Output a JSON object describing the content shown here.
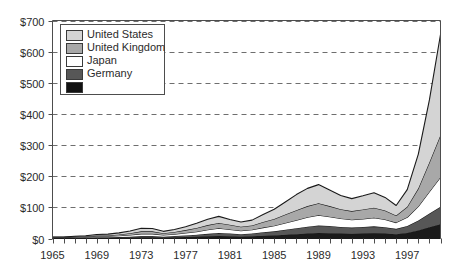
{
  "chart_data": {
    "type": "area",
    "stacked": true,
    "title": "",
    "subtitle": "",
    "xlabel": "",
    "ylabel": "",
    "xlim": [
      1965,
      2000
    ],
    "ylim": [
      0,
      700
    ],
    "grid": true,
    "grid_style": "dashed-horizontal",
    "legend_position": "top-left",
    "y_tick_labels": [
      "$0",
      "$100",
      "$200",
      "$300",
      "$400",
      "$500",
      "$600",
      "$700"
    ],
    "y_tick_values": [
      0,
      100,
      200,
      300,
      400,
      500,
      600,
      700
    ],
    "x_tick_labels": [
      "1965",
      "1969",
      "1973",
      "1977",
      "1981",
      "1985",
      "1989",
      "1993",
      "1997"
    ],
    "x_tick_values": [
      1965,
      1969,
      1973,
      1977,
      1981,
      1985,
      1989,
      1993,
      1997
    ],
    "x_minor_tick_interval": 1,
    "x": [
      1965,
      1966,
      1967,
      1968,
      1969,
      1970,
      1971,
      1972,
      1973,
      1974,
      1975,
      1976,
      1977,
      1978,
      1979,
      1980,
      1981,
      1982,
      1983,
      1984,
      1985,
      1986,
      1987,
      1988,
      1989,
      1990,
      1991,
      1992,
      1993,
      1994,
      1995,
      1996,
      1997,
      1998,
      1999,
      2000
    ],
    "series": [
      {
        "name": "Germany",
        "color": "#1a1a1a",
        "legend_order": 5,
        "stack_order": 1,
        "values": [
          1,
          1,
          1,
          2,
          2,
          2,
          3,
          3,
          4,
          4,
          3,
          4,
          5,
          6,
          7,
          8,
          7,
          6,
          7,
          9,
          10,
          12,
          14,
          16,
          18,
          17,
          16,
          15,
          16,
          17,
          16,
          14,
          18,
          26,
          36,
          46
        ]
      },
      {
        "name": "Japan",
        "color": "#575757",
        "legend_order": 4,
        "stack_order": 2,
        "values": [
          1,
          1,
          1,
          1,
          2,
          2,
          2,
          3,
          4,
          4,
          3,
          4,
          5,
          6,
          8,
          10,
          9,
          8,
          9,
          11,
          13,
          16,
          19,
          22,
          24,
          23,
          21,
          20,
          21,
          22,
          20,
          17,
          22,
          32,
          44,
          56
        ]
      },
      {
        "name": "United Kingdom",
        "color": "#ffffff",
        "legend_order": 3,
        "stack_order": 3,
        "values": [
          1,
          1,
          2,
          2,
          3,
          3,
          4,
          5,
          7,
          7,
          5,
          6,
          8,
          10,
          13,
          15,
          13,
          11,
          12,
          15,
          18,
          22,
          26,
          30,
          33,
          30,
          27,
          25,
          26,
          28,
          25,
          20,
          28,
          45,
          70,
          95
        ]
      },
      {
        "name": "United States",
        "color": "#a8a8a8",
        "legend_order": 2,
        "stack_order": 4,
        "values": [
          1,
          1,
          2,
          2,
          3,
          3,
          4,
          6,
          8,
          8,
          6,
          7,
          9,
          12,
          15,
          17,
          15,
          13,
          14,
          18,
          22,
          27,
          32,
          36,
          38,
          34,
          30,
          28,
          30,
          32,
          29,
          23,
          34,
          58,
          95,
          135
        ]
      },
      {
        "name": "United States",
        "color": "#d4d4d4",
        "legend_order": 1,
        "stack_order": 5,
        "values": [
          1,
          1,
          1,
          2,
          3,
          4,
          5,
          7,
          10,
          9,
          6,
          8,
          11,
          15,
          19,
          21,
          17,
          15,
          17,
          24,
          31,
          40,
          50,
          57,
          60,
          52,
          44,
          40,
          44,
          48,
          42,
          32,
          55,
          110,
          200,
          323
        ]
      }
    ],
    "stack_totals": [
      5,
      5,
      7,
      9,
      13,
      14,
      18,
      24,
      33,
      32,
      23,
      29,
      38,
      49,
      62,
      71,
      61,
      53,
      59,
      77,
      94,
      117,
      141,
      161,
      173,
      156,
      138,
      128,
      137,
      147,
      132,
      106,
      157,
      271,
      445,
      655
    ],
    "notes": {
      "peak_label": "$655 at 2000",
      "local_peak_1989": "$173 total area peak near 1989",
      "legend_swatch_count": 5,
      "legend_label_count": 4
    }
  },
  "legend": {
    "entries": [
      {
        "label": "United States",
        "swatch": "#d4d4d4"
      },
      {
        "label": "United Kingdom",
        "swatch": "#a8a8a8"
      },
      {
        "label": "Japan",
        "swatch": "#ffffff"
      },
      {
        "label": "Germany",
        "swatch": "#575757"
      },
      {
        "label": "",
        "swatch": "#111111"
      }
    ]
  },
  "style": {
    "plot_background": "#ffffff",
    "axis_color": "#4d4d4d",
    "grid_color": "#6e6e6e",
    "line_color": "#1a1a1a",
    "text_color": "#2b2b2b"
  }
}
